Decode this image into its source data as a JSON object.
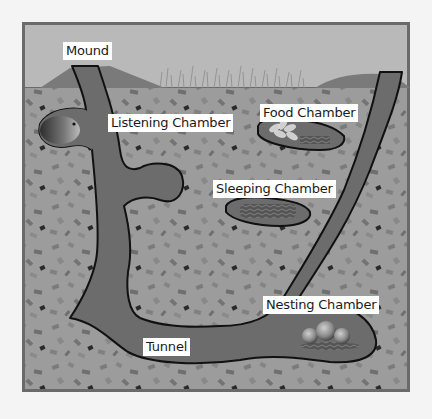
{
  "diagram": {
    "colors": {
      "page_bg": "#f4f4f4",
      "frame": "#6a6a6a",
      "sky": "#b9b9b9",
      "mound": "#7a7a7a",
      "soil": "#9c9c9c",
      "tunnel": "#6c6c6c",
      "outline": "#111111",
      "label_bg": "#ffffff"
    },
    "labels": {
      "mound": "Mound",
      "listening_chamber": "Listening Chamber",
      "food_chamber": "Food Chamber",
      "sleeping_chamber": "Sleeping Chamber",
      "nesting_chamber": "Nesting Chamber",
      "tunnel": "Tunnel"
    }
  }
}
